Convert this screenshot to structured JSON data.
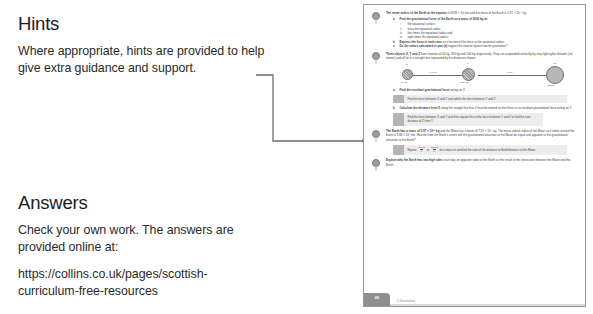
{
  "left_column": {
    "hints": {
      "heading": "Hints",
      "body": "Where appropriate, hints are provided to help give extra guidance and support."
    },
    "answers": {
      "heading": "Answers",
      "body": "Check your own work. The answers are provided online at:",
      "url": "https://collins.co.uk/pages/scottish-curriculum-free-resources"
    }
  },
  "colors": {
    "page_border": "#9a9a9a",
    "leader_line": "#6f6f6f",
    "hint_box_bg": "#ededed",
    "hint_icon_bg": "#b4b4b4",
    "page_tab_bg": "#8f8f8f",
    "text": "#231f20"
  },
  "page_preview": {
    "questions": [
      {
        "number": "1",
        "stem_bold": "The mean radius of the Earth at the equator",
        "stem_rest": " is 6378 × 10³ km and the mass of the Earth is 5.97 × 10²⁴ kg.",
        "parts": [
          {
            "label": "a",
            "bold": "Find the gravitational force of the Earth on a mass of 5000 kg at:",
            "rest": "",
            "romans": [
              {
                "label": "i",
                "text": "the equatorial surface"
              },
              {
                "label": "ii",
                "text": "twice the equatorial radius"
              },
              {
                "label": "iii",
                "text": "four times the equatorial radius and"
              },
              {
                "label": "iv",
                "text": "eight times the equatorial radius."
              }
            ]
          },
          {
            "label": "b",
            "bold": "Express the force in each case",
            "rest": " as a fraction of the force at the equatorial radius.",
            "romans": []
          },
          {
            "label": "c",
            "bold": "Do the values calculated in part (a)",
            "rest": " support the inverse square law for gravitation?",
            "romans": []
          }
        ]
      },
      {
        "number": "2",
        "stem_bold": "Three objects X, Y and Z",
        "stem_rest": " have masses of 34 kg, 350 kg and 140 kg respectively. They are suspended vertically by very light nylon threads (not shown) and all lie in a straight line separated by the distances shown.",
        "diagram": {
          "bodies": [
            {
              "top_label": "X",
              "bottom_label": "34 kg"
            },
            {
              "top_label": "Y",
              "bottom_label": "350 kg"
            },
            {
              "top_label": "Z",
              "bottom_label": "140 kg"
            }
          ],
          "gap_labels": [
            "3.40 m",
            "4.8 m"
          ]
        },
        "parts": [
          {
            "label": "a",
            "bold": "Find the resultant gravitational force",
            "rest": " acting on Z.",
            "romans": []
          },
          {
            "label": "b",
            "bold": "Calculate the distance from X",
            "rest": " along the straight line that Z must be moved so that there is no resultant gravitational force acting on Y.",
            "romans": []
          }
        ],
        "hints": [
          {
            "text": "Find the force between X and Z and add to the force between Y and Z.",
            "width": "wide"
          },
          {
            "text": "Find the force between X and Y and then equate this to the force between Y and Z to find the new distance of Z from Y.",
            "width": "narrow"
          }
        ]
      },
      {
        "number": "3",
        "stem_bold": "The Earth has a mass of 5.97 × 10²⁴ kg",
        "stem_rest": " and the Moon has a mass of 7.35 × 10²² kg. The mean orbital radius of the Moon as it orbits around the Earth is 3.84 × 10⁵ km. How far from the Earth's centre will the gravitational attraction to the Moon be equal and opposite to the gravitational attraction to the Earth?",
        "parts": [],
        "hints": [
          {
            "text_pre": "Equate ",
            "frac1": {
              "num": "GM₁m",
              "den": "r₁²"
            },
            "text_mid": " to ",
            "frac2": {
              "num": "GM₂m",
              "den": "r₂²"
            },
            "text_post": " for a mass m and find the ratio of the distance to Earth/distance to the Moon.",
            "width": "wide"
          }
        ]
      },
      {
        "number": "4",
        "stem_bold": "Explain why the Earth has two high tides",
        "stem_rest": " each day on opposite sides of the Earth as the result of the interaction between the Moon and the Earth.",
        "parts": []
      }
    ],
    "footer": {
      "page_number": "48",
      "note": "1 Gravitation"
    }
  }
}
